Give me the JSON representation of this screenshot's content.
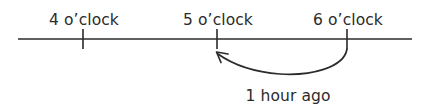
{
  "figure": {
    "type": "number-line-diagram",
    "background_color": "#ffffff",
    "ink_color": "#2b2b2b"
  },
  "axis": {
    "name": "time-number-line",
    "x_start": 18,
    "x_end": 412,
    "y": 39
  },
  "ticks": [
    {
      "label": "4 o’clock",
      "x": 83,
      "label_x": 84,
      "label_y": 25
    },
    {
      "label": "5 o’clock",
      "x": 217,
      "label_x": 218,
      "label_y": 25
    },
    {
      "label": "6 o’clock",
      "x": 347,
      "label_x": 348,
      "label_y": 25
    }
  ],
  "annotation": {
    "label": "1 hour ago",
    "label_x": 288,
    "label_y": 101,
    "from_tick_index": 2,
    "to_tick_index": 1,
    "direction": "backward",
    "arrow_path": "M 347 49 C 344 68 310 76 280 74 C 254 72 232 64 218 54",
    "arrow_head_path": "M 228 54 L 216.5 52 L 221 62.5"
  },
  "chart_data": {
    "type": "line",
    "title": "",
    "xlabel": "",
    "ylabel": "",
    "categories": [
      "4 o’clock",
      "5 o’clock",
      "6 o’clock"
    ],
    "values": [
      4,
      5,
      6
    ],
    "annotations": [
      {
        "text": "1 hour ago",
        "from": "6 o’clock",
        "to": "5 o’clock",
        "style": "curved-arrow-below-axis"
      }
    ],
    "grid": false,
    "legend": "none"
  }
}
